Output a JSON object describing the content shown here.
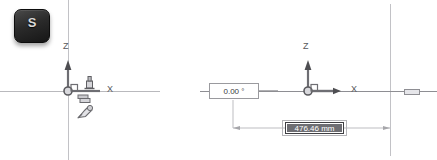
{
  "app": {
    "kind": "cad-3d-compass-manipulation",
    "background": "#ffffff",
    "line_color": "#b9b9bd",
    "axis_color": "#6e6e73",
    "text_color": "#3c3c40",
    "selection_color": "#6e6e73"
  },
  "left_panel": {
    "name": "before-state",
    "key_hint": {
      "glyph": "S",
      "sublabel": "",
      "tooltip": "S key"
    },
    "axes": {
      "z_label": "Z",
      "x_label": "X",
      "origin_marker": "origin-circle"
    },
    "glyphs": {
      "snap_tool": "snap-handle-icon",
      "drag_tool": "drag-cursor-icon",
      "grip": "axis-grip-icon"
    }
  },
  "right_panel": {
    "name": "after-state",
    "axes": {
      "z_label": "Z",
      "x_label": "X",
      "origin_marker": "origin-circle"
    },
    "angle_field": {
      "value": "0.00 °",
      "placeholder": "0.00 °",
      "selected": false
    },
    "distance_field": {
      "value": "476.46 mm",
      "placeholder": "0.00 mm",
      "selected": true
    },
    "handle": {
      "name": "drag-handle",
      "label": ""
    },
    "dimension_line": {
      "start_label": "",
      "end_label": "",
      "arrows": "both"
    }
  }
}
